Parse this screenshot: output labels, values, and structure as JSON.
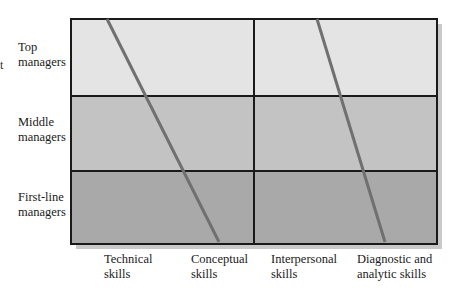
{
  "diagram": {
    "edge_fragment": "t",
    "rows": [
      {
        "label_line1": "Top",
        "label_line2": "managers"
      },
      {
        "label_line1": "Middle",
        "label_line2": "managers"
      },
      {
        "label_line1": "First-line",
        "label_line2": "managers"
      }
    ],
    "columns": [
      {
        "label_line1": "Technical",
        "label_line2": "skills"
      },
      {
        "label_line1": "Conceptual",
        "label_line2": "skills"
      },
      {
        "label_line1": "Interpersonal",
        "label_line2": "skills"
      },
      {
        "label_line1": "Diagnostic and",
        "label_line2": "analytic skills"
      }
    ],
    "colors": {
      "top_band": "#e4e4e4",
      "middle_band": "#c3c3c3",
      "bottom_band": "#a9a9a9",
      "divider_lines": "#707070",
      "border": "#1a1a1a"
    }
  }
}
